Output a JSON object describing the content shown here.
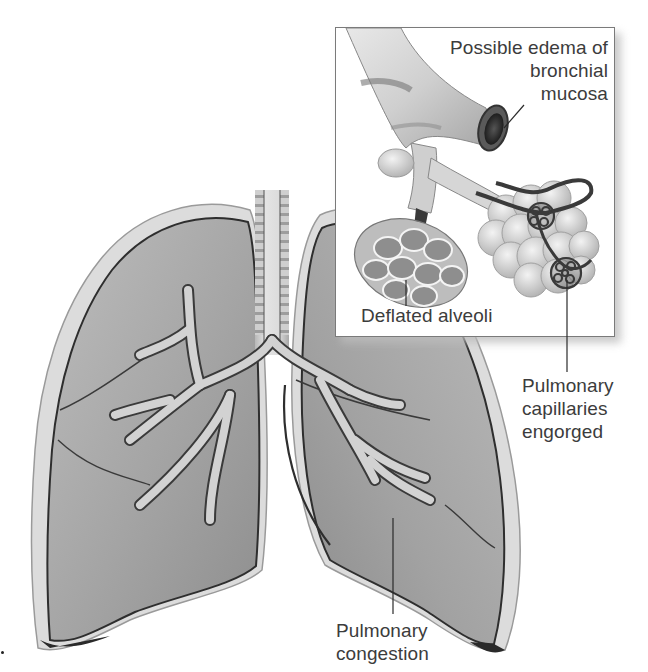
{
  "diagram": {
    "colors": {
      "background": "#ffffff",
      "lung_fill": "#a9a9a9",
      "lung_outline": "#2e2e2e",
      "pleura": "#d9d9d9",
      "airway": "#c8c8c8",
      "capillary": "#3a3a3a",
      "label_text": "#3c3c3c",
      "leader_line": "#2a2a2a"
    },
    "labels": {
      "edema": {
        "lines": [
          "Possible edema of",
          "bronchial",
          "mucosa"
        ]
      },
      "deflated": {
        "lines": [
          "Deflated alveoli"
        ]
      },
      "capillaries": {
        "lines": [
          "Pulmonary",
          "capillaries",
          "engorged"
        ]
      },
      "congestion": {
        "lines": [
          "Pulmonary",
          "congestion"
        ]
      }
    },
    "parts": {
      "main": [
        "left-lung",
        "right-lung",
        "trachea",
        "bronchial-tree"
      ],
      "inset": [
        "bronchus",
        "bronchiole",
        "deflated-alveoli-cluster",
        "alveolar-sacs",
        "capillary-network"
      ]
    }
  }
}
